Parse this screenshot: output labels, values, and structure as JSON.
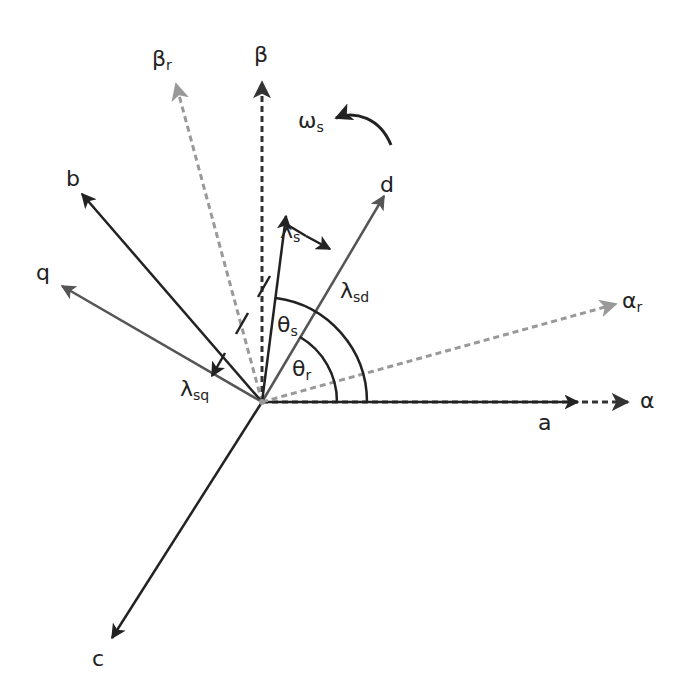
{
  "diagram": {
    "origin": {
      "x": 262,
      "y": 402
    },
    "colors": {
      "abc_axes": "#222222",
      "alpha_beta_axes": "#333333",
      "rotor_axes": "#999999",
      "dq_axes": "#555555",
      "flux_vector": "#222222",
      "arc": "#222222"
    },
    "labels": {
      "a": "a",
      "b": "b",
      "c": "c",
      "alpha": "α",
      "beta": "β",
      "alpha_r": {
        "main": "α",
        "sub": "r"
      },
      "beta_r": {
        "main": "β",
        "sub": "r"
      },
      "d": "d",
      "q": "q",
      "lambda_s": {
        "main": "λ",
        "sub": "s"
      },
      "lambda_sd": {
        "main": "λ",
        "sub": "sd"
      },
      "lambda_sq": {
        "main": "λ",
        "sub": "sq"
      },
      "theta_s": {
        "main": "θ",
        "sub": "s"
      },
      "theta_r": {
        "main": "θ",
        "sub": "r"
      },
      "omega_s": {
        "main": "ω",
        "sub": "s"
      }
    },
    "vectors": [
      {
        "name": "a-axis",
        "style": "solid",
        "to": [
          578,
          402
        ]
      },
      {
        "name": "alpha-axis",
        "style": "dashed",
        "to": [
          628,
          402
        ]
      },
      {
        "name": "b-axis",
        "style": "solid",
        "to": [
          82,
          194
        ]
      },
      {
        "name": "c-axis",
        "style": "solid",
        "to": [
          112,
          638
        ]
      },
      {
        "name": "beta-axis",
        "style": "dashed",
        "to": [
          262,
          82
        ]
      },
      {
        "name": "beta-r-axis",
        "style": "dashed",
        "to": [
          176,
          84
        ]
      },
      {
        "name": "alpha-r-axis",
        "style": "dashed",
        "to": [
          616,
          304
        ]
      },
      {
        "name": "d-axis",
        "style": "solid",
        "to": [
          384,
          196
        ]
      },
      {
        "name": "q-axis",
        "style": "solid",
        "to": [
          62,
          286
        ]
      },
      {
        "name": "lambda-s",
        "style": "solid",
        "to": [
          286,
          216
        ]
      }
    ]
  }
}
